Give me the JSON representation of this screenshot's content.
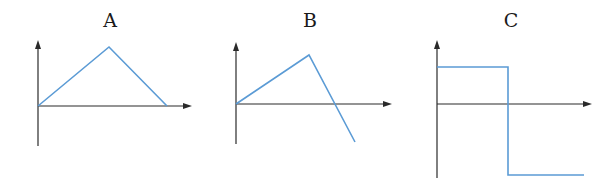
{
  "colors": {
    "axis": "#2a2a2a",
    "curve": "#5b9bd5",
    "background": "#ffffff"
  },
  "graphs": [
    {
      "label": "A",
      "label_pos": [
        110,
        11
      ],
      "axes": {
        "origin": [
          38,
          106
        ],
        "y_top": 40,
        "y_bottom": 146,
        "x_right": 192
      },
      "curve": [
        [
          38,
          106
        ],
        [
          109,
          47
        ],
        [
          167,
          106
        ]
      ]
    },
    {
      "label": "B",
      "label_pos": [
        310,
        11
      ],
      "axes": {
        "origin": [
          236,
          104
        ],
        "y_top": 42,
        "y_bottom": 144,
        "x_right": 392
      },
      "curve": [
        [
          236,
          104
        ],
        [
          309,
          55
        ],
        [
          355,
          142
        ]
      ]
    },
    {
      "label": "C",
      "label_pos": [
        511,
        11
      ],
      "axes": {
        "origin": [
          437,
          104
        ],
        "y_top": 40,
        "y_bottom": 178,
        "x_right": 592
      },
      "curve": [
        [
          437,
          67
        ],
        [
          508,
          67
        ],
        [
          508,
          175
        ],
        [
          584,
          175
        ]
      ]
    }
  ]
}
